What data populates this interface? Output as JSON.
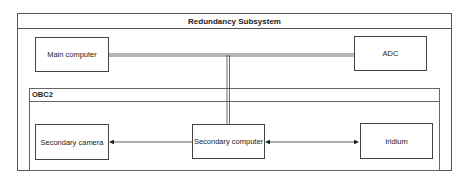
{
  "diagram": {
    "title": "Redundancy Subsystem",
    "group": {
      "label": "OBC2"
    },
    "nodes": {
      "main_computer": "Main computer",
      "adc": "ADC",
      "secondary_camera": "Secondary camera",
      "secondary_computer": "Secondary computer",
      "iridium": "Iridium"
    },
    "edges": [
      {
        "from": "Main computer",
        "to": "ADC",
        "style": "double-line bus"
      },
      {
        "from": "bus",
        "to": "Secondary computer",
        "style": "double-line"
      },
      {
        "from": "Secondary computer",
        "to": "Secondary camera",
        "style": "arrow"
      },
      {
        "from": "Secondary computer",
        "to": "Iridium",
        "style": "bidirectional arrow"
      }
    ]
  }
}
